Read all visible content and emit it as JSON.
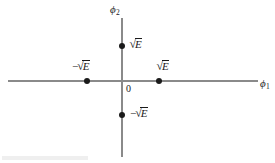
{
  "figure": {
    "title": "",
    "background_color": "#ffffff",
    "axis_color": "#8a8a8a",
    "point_color": "#1a1a1a",
    "text_color": "#1a1a1a"
  },
  "axes": {
    "x_label_symbol": "ϕ",
    "x_label_subscript": "1",
    "y_label_symbol": "ϕ",
    "y_label_subscript": "2",
    "origin_label": "0"
  },
  "labels": {
    "sqrt_symbol": "√",
    "radicand": "E",
    "minus_sign": "−",
    "empty": ""
  },
  "chart_data": {
    "type": "scatter",
    "title": "",
    "xlabel": "ϕ1",
    "ylabel": "ϕ2",
    "xlim": [
      -2.3,
      2.5
    ],
    "ylim": [
      -1.3,
      1.2
    ],
    "grid": false,
    "legend": null,
    "points": [
      {
        "label": "√E",
        "x": 1,
        "y": 0,
        "label_position": "above"
      },
      {
        "label": "−√E",
        "x": -1,
        "y": 0,
        "label_position": "above"
      },
      {
        "label": "√E",
        "x": 0,
        "y": 1,
        "label_position": "right"
      },
      {
        "label": "−√E",
        "x": 0,
        "y": -1,
        "label_position": "right"
      }
    ],
    "annotations": [
      {
        "text": "0",
        "x": 0.1,
        "y": -0.1
      }
    ]
  }
}
